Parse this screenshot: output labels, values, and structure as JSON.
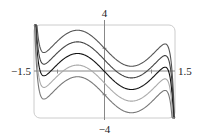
{
  "chart_data": {
    "type": "line",
    "title": "",
    "xlabel": "",
    "ylabel": "",
    "xlim": [
      -1.5,
      1.5
    ],
    "ylim": [
      -4,
      4
    ],
    "tick_labels": {
      "x_min": "−1.5",
      "x_max": "1.5",
      "y_max": "4",
      "y_min": "−4"
    },
    "x_ticks": [
      -1,
      1
    ],
    "y_ticks": [
      -2,
      2
    ],
    "grid": false,
    "legend": null,
    "frame": "rounded-rectangle",
    "series": [
      {
        "name": "C = 2",
        "offset": 2,
        "color": "#555555",
        "y_at_0": 2
      },
      {
        "name": "C = 1",
        "offset": 1,
        "color": "#444444",
        "y_at_0": 1
      },
      {
        "name": "C = 0",
        "offset": 0,
        "color": "#111111",
        "y_at_0": 0
      },
      {
        "name": "C = -1",
        "offset": -1,
        "color": "#aaaaaa",
        "y_at_0": -1
      },
      {
        "name": "C = -2",
        "offset": -2,
        "color": "#777777",
        "y_at_0": -2
      }
    ]
  },
  "colors": {
    "axis": "#888888",
    "frame": "#cccccc"
  }
}
